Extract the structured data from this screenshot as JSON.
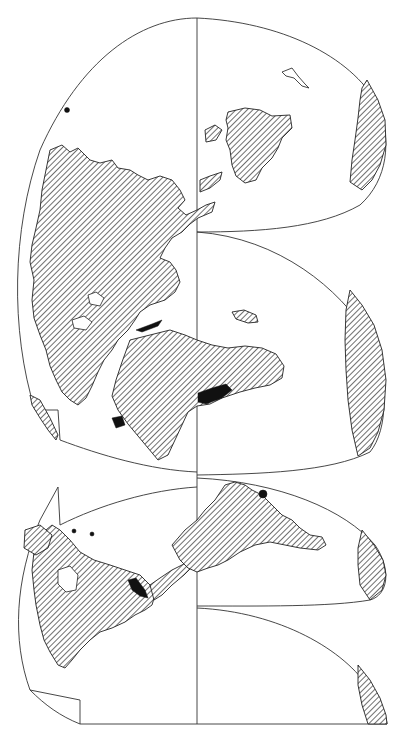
{
  "map": {
    "type": "interrupted world map projection (rotated 90°)",
    "orientation": "north to the left, south to the right, equator vertical",
    "colors": {
      "background": "#ffffff",
      "outline": "#333333",
      "land_hatch": "#222222",
      "solid_region": "#111111"
    },
    "equator": {
      "x": 197,
      "y_start": 18,
      "y_end": 724
    },
    "lobes": [
      {
        "name": "northern-eurasia-africa",
        "hemisphere": "north"
      },
      {
        "name": "northern-americas",
        "hemisphere": "north"
      },
      {
        "name": "southern-australia-pacific",
        "hemisphere": "south"
      },
      {
        "name": "southern-indian-ocean",
        "hemisphere": "south"
      },
      {
        "name": "southern-south-america",
        "hemisphere": "south"
      },
      {
        "name": "southern-pacific",
        "hemisphere": "south"
      }
    ],
    "landmasses": [
      "Eurasia",
      "Africa",
      "Australia",
      "North America",
      "South America",
      "Antarctica"
    ],
    "fill_styles": {
      "land": "diagonal hatch",
      "highlighted": "solid black"
    }
  }
}
